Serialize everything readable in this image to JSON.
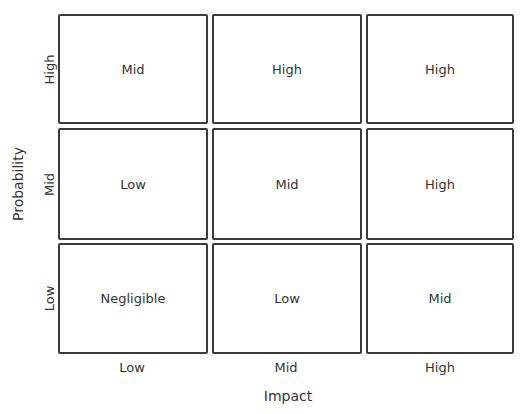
{
  "diagram": {
    "y_axis": {
      "label": "Probability",
      "levels": [
        "High",
        "Mid",
        "Low"
      ]
    },
    "x_axis": {
      "label": "Impact",
      "levels": [
        "Low",
        "Mid",
        "High"
      ]
    },
    "rows": [
      {
        "probability": "High",
        "cells": [
          "Mid",
          "High",
          "High"
        ]
      },
      {
        "probability": "Mid",
        "cells": [
          "Low",
          "Mid",
          "High"
        ]
      },
      {
        "probability": "Low",
        "cells": [
          "Negligible",
          "Low",
          "Mid"
        ]
      }
    ]
  }
}
